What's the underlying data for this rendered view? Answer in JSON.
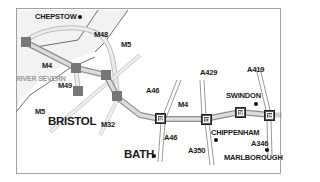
{
  "map": {
    "title": "M4 corridor: Bristol to Swindon",
    "colors": {
      "frame": "#8a8a8a",
      "motorway_fill": "#d9d9d9",
      "motorway_edge": "#9a9a9a",
      "a_road": "#666666",
      "estuary": "#f1f1f1",
      "junction": "#555555",
      "text": "#1a1a1a",
      "river_text": "#9a9a9a"
    },
    "towns": [
      {
        "name": "CHEPSTOW",
        "size": "small"
      },
      {
        "name": "BRISTOL",
        "size": "large"
      },
      {
        "name": "BATH",
        "size": "large"
      },
      {
        "name": "SWINDON",
        "size": "small"
      },
      {
        "name": "CHIPPENHAM",
        "size": "small"
      },
      {
        "name": "MARLBOROUGH",
        "size": "small"
      }
    ],
    "water": {
      "river_label": "RIVER SEVERN"
    },
    "roads": {
      "motorways": [
        "M4",
        "M48",
        "M5",
        "M49",
        "M5",
        "M32",
        "M4"
      ],
      "a_roads": [
        "A46",
        "A46",
        "A429",
        "A350",
        "A419",
        "A346"
      ]
    },
    "junctions": [
      "18",
      "17",
      "16",
      "15"
    ]
  }
}
